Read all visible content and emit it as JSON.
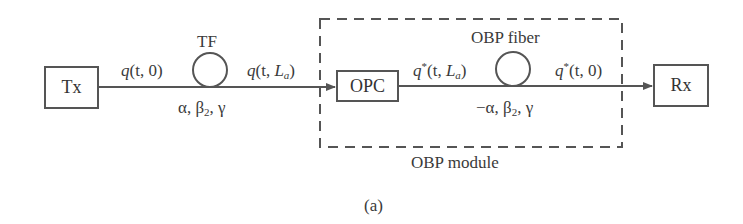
{
  "diagram": {
    "blocks": {
      "tx": "Tx",
      "opc": "OPC",
      "rx": "Rx"
    },
    "fiber_labels": {
      "tf": "TF",
      "obp_fiber": "OBP fiber"
    },
    "signals": {
      "q_t0": {
        "q": "q",
        "args": "(t, 0)"
      },
      "q_tLa": {
        "q": "q",
        "pre": "(t, ",
        "L": "L",
        "sub": "a",
        "post": ")"
      },
      "qstar_tLa": {
        "q": "q",
        "star": "*",
        "pre": "(t, ",
        "L": "L",
        "sub": "a",
        "post": ")"
      },
      "qstar_t0": {
        "q": "q",
        "star": "*",
        "args": "(t, 0)"
      }
    },
    "params": {
      "tf": {
        "pre": "α, β",
        "sub": "2",
        "post": ", γ"
      },
      "obp": {
        "pre": "−α, β",
        "sub": "2",
        "post": ", γ"
      }
    },
    "module_label": "OBP module",
    "caption": "(a)"
  },
  "colors": {
    "line": "#555555",
    "text": "#333333",
    "background": "#ffffff"
  }
}
